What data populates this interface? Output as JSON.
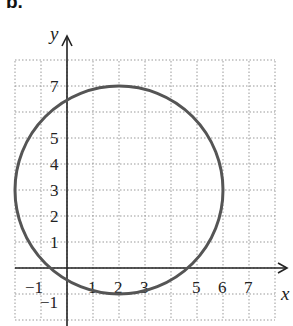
{
  "panel_label": "b.",
  "chart_data": {
    "type": "line",
    "title": "",
    "shape": {
      "kind": "circle",
      "center": [
        2,
        3
      ],
      "radius": 4
    },
    "xlabel": "x",
    "ylabel": "y",
    "x_ticks": [
      "−1",
      "1",
      "2",
      "3",
      "5",
      "6",
      "7"
    ],
    "y_ticks": [
      "7",
      "5",
      "4",
      "3",
      "2",
      "1",
      "−1"
    ],
    "xlim": [
      -2,
      8
    ],
    "ylim": [
      -2,
      8
    ],
    "grid": true,
    "legend": null
  }
}
